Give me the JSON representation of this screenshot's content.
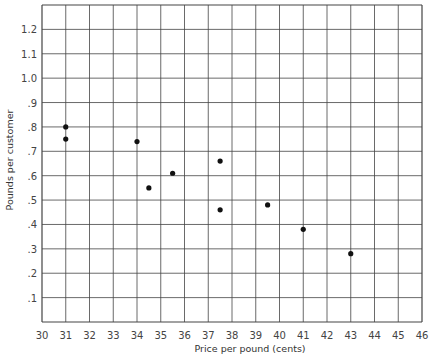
{
  "chart_data": {
    "type": "scatter",
    "title": "",
    "xlabel": "Price per pound (cents)",
    "ylabel": "Pounds per customer",
    "xlim": [
      30,
      46
    ],
    "ylim": [
      0,
      1.3
    ],
    "grid": true,
    "legend": null,
    "x_ticks": [
      "30",
      "31",
      "32",
      "33",
      "34",
      "35",
      "36",
      "37",
      "38",
      "39",
      "40",
      "41",
      "42",
      "43",
      "44",
      "45",
      "46"
    ],
    "y_ticks": [
      ".1",
      ".2",
      ".3",
      ".4",
      ".5",
      ".6",
      ".7",
      ".8",
      ".9",
      "1.0",
      "1.1",
      "1.2"
    ],
    "series": [
      {
        "name": "observations",
        "points": [
          {
            "x": 31.0,
            "y": 0.8
          },
          {
            "x": 31.0,
            "y": 0.75
          },
          {
            "x": 34.0,
            "y": 0.74
          },
          {
            "x": 34.5,
            "y": 0.55
          },
          {
            "x": 35.5,
            "y": 0.61
          },
          {
            "x": 37.5,
            "y": 0.66
          },
          {
            "x": 37.5,
            "y": 0.46
          },
          {
            "x": 39.5,
            "y": 0.48
          },
          {
            "x": 41.0,
            "y": 0.38
          },
          {
            "x": 43.0,
            "y": 0.28
          }
        ]
      }
    ]
  },
  "colors": {
    "grid": "#444444",
    "point": "#111111",
    "text": "#333333"
  }
}
